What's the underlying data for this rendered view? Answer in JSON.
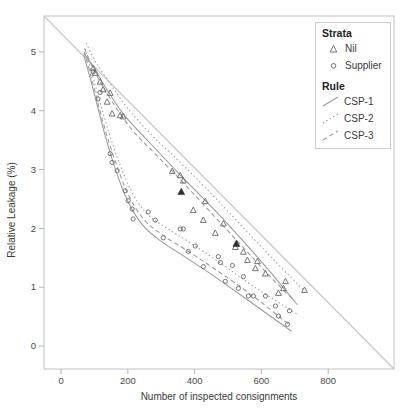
{
  "colors": {
    "panel_border": "#c2c2c2",
    "tick": "#b3b3b3",
    "reference": "#cacaca",
    "line": "#9a9a9a",
    "marker": "#676767",
    "highlight": "#2f2f2f",
    "text": "#3d3d3d"
  },
  "chart_data": {
    "type": "scatter",
    "title": "",
    "xlabel": "Number of inspected consignments",
    "ylabel": "Relative Leakage (%)",
    "xlim": [
      -51,
      997
    ],
    "ylim": [
      -0.39,
      5.61
    ],
    "x_ticks": [
      0,
      200,
      400,
      600,
      800
    ],
    "y_ticks": [
      0,
      1,
      2,
      3,
      4,
      5
    ],
    "grid": false,
    "legend": {
      "position": "top-right",
      "strata_title": "Strata",
      "strata_items": [
        {
          "label": "Nil",
          "marker": "triangle"
        },
        {
          "label": "Supplier",
          "marker": "circle"
        }
      ],
      "rule_title": "Rule",
      "rule_items": [
        {
          "label": "CSP-1",
          "linestyle": "solid"
        },
        {
          "label": "CSP-2",
          "linestyle": "dotted"
        },
        {
          "label": "CSP-3",
          "linestyle": "dashed"
        }
      ]
    },
    "reference_line": {
      "from": [
        -51,
        5.61
      ],
      "to": [
        997,
        -0.39
      ]
    },
    "series": [
      {
        "name": "Nil CSP-1",
        "strata": "Nil",
        "rule": "CSP-1",
        "marker": "triangle",
        "linestyle": "solid",
        "line": [
          [
            68,
            4.98
          ],
          [
            100,
            4.72
          ],
          [
            135,
            4.38
          ],
          [
            190,
            3.92
          ],
          [
            265,
            3.46
          ],
          [
            355,
            2.92
          ],
          [
            445,
            2.4
          ],
          [
            535,
            1.85
          ],
          [
            625,
            1.27
          ],
          [
            708,
            0.7
          ]
        ],
        "points": [
          [
            102,
            4.64
          ],
          [
            126,
            4.36
          ],
          [
            153,
            3.95
          ],
          [
            357,
            2.9
          ],
          [
            432,
            2.46
          ],
          [
            486,
            2.08
          ],
          [
            558,
            1.46
          ],
          [
            612,
            1.23
          ],
          [
            666,
            0.98
          ]
        ]
      },
      {
        "name": "Nil CSP-2",
        "strata": "Nil",
        "rule": "CSP-2",
        "marker": "triangle",
        "linestyle": "dotted",
        "line": [
          [
            75,
            5.15
          ],
          [
            105,
            4.82
          ],
          [
            145,
            4.48
          ],
          [
            205,
            4.0
          ],
          [
            278,
            3.55
          ],
          [
            368,
            3.06
          ],
          [
            458,
            2.54
          ],
          [
            548,
            2.0
          ],
          [
            638,
            1.46
          ],
          [
            730,
            0.93
          ]
        ],
        "points": [
          [
            117,
            4.49
          ],
          [
            147,
            4.3
          ],
          [
            177,
            3.92
          ],
          [
            333,
            2.97
          ],
          [
            366,
            2.81
          ],
          [
            426,
            2.14
          ],
          [
            546,
            1.6
          ],
          [
            588,
            1.44
          ],
          [
            672,
            1.1
          ],
          [
            729,
            0.95
          ]
        ]
      },
      {
        "name": "Nil CSP-3",
        "strata": "Nil",
        "rule": "CSP-3",
        "marker": "triangle",
        "linestyle": "dashed",
        "line": [
          [
            70,
            5.06
          ],
          [
            105,
            4.62
          ],
          [
            150,
            4.18
          ],
          [
            215,
            3.66
          ],
          [
            290,
            3.22
          ],
          [
            375,
            2.72
          ],
          [
            460,
            2.2
          ],
          [
            545,
            1.68
          ],
          [
            630,
            1.16
          ],
          [
            700,
            0.76
          ]
        ],
        "points": [
          [
            96,
            4.72
          ],
          [
            138,
            4.15
          ],
          [
            186,
            3.9
          ],
          [
            396,
            2.31
          ],
          [
            462,
            1.92
          ],
          [
            522,
            1.68
          ],
          [
            582,
            1.32
          ],
          [
            651,
            0.9
          ]
        ]
      },
      {
        "name": "Supplier CSP-1",
        "strata": "Supplier",
        "rule": "CSP-1",
        "marker": "circle",
        "linestyle": "solid",
        "line": [
          [
            68,
            4.95
          ],
          [
            100,
            4.28
          ],
          [
            130,
            3.62
          ],
          [
            162,
            3.02
          ],
          [
            200,
            2.46
          ],
          [
            245,
            2.05
          ],
          [
            300,
            1.78
          ],
          [
            370,
            1.52
          ],
          [
            460,
            1.18
          ],
          [
            560,
            0.78
          ],
          [
            690,
            0.25
          ]
        ],
        "points": [
          [
            117,
            4.31
          ],
          [
            147,
            3.27
          ],
          [
            192,
            2.64
          ],
          [
            213,
            2.33
          ],
          [
            306,
            1.84
          ],
          [
            381,
            1.61
          ],
          [
            426,
            1.35
          ],
          [
            492,
            1.1
          ],
          [
            561,
            0.85
          ],
          [
            642,
            0.68
          ],
          [
            678,
            0.37
          ]
        ]
      },
      {
        "name": "Supplier CSP-2",
        "strata": "Supplier",
        "rule": "CSP-2",
        "marker": "circle",
        "linestyle": "dotted",
        "line": [
          [
            72,
            5.05
          ],
          [
            105,
            4.38
          ],
          [
            136,
            3.76
          ],
          [
            170,
            3.18
          ],
          [
            210,
            2.64
          ],
          [
            255,
            2.26
          ],
          [
            312,
            2.02
          ],
          [
            385,
            1.76
          ],
          [
            475,
            1.42
          ],
          [
            575,
            1.02
          ],
          [
            705,
            0.55
          ]
        ],
        "points": [
          [
            96,
            4.66
          ],
          [
            153,
            3.12
          ],
          [
            201,
            2.47
          ],
          [
            282,
            2.14
          ],
          [
            366,
            1.99
          ],
          [
            477,
            1.42
          ],
          [
            513,
            1.37
          ],
          [
            546,
            1.18
          ],
          [
            612,
            0.85
          ],
          [
            684,
            0.6
          ]
        ]
      },
      {
        "name": "Supplier CSP-3",
        "strata": "Supplier",
        "rule": "CSP-3",
        "marker": "circle",
        "linestyle": "dashed",
        "line": [
          [
            70,
            5.0
          ],
          [
            102,
            4.32
          ],
          [
            132,
            3.68
          ],
          [
            165,
            3.1
          ],
          [
            204,
            2.54
          ],
          [
            250,
            2.14
          ],
          [
            306,
            1.88
          ],
          [
            378,
            1.62
          ],
          [
            468,
            1.28
          ],
          [
            568,
            0.88
          ],
          [
            680,
            0.38
          ]
        ],
        "points": [
          [
            111,
            4.2
          ],
          [
            168,
            2.98
          ],
          [
            216,
            2.16
          ],
          [
            261,
            2.28
          ],
          [
            357,
            1.99
          ],
          [
            402,
            1.7
          ],
          [
            471,
            1.52
          ],
          [
            531,
            0.98
          ],
          [
            576,
            0.85
          ],
          [
            651,
            0.51
          ]
        ]
      }
    ],
    "highlight_points": {
      "marker": "filled-triangle",
      "points": [
        [
          360,
          2.62
        ],
        [
          525,
          1.74
        ]
      ]
    }
  }
}
